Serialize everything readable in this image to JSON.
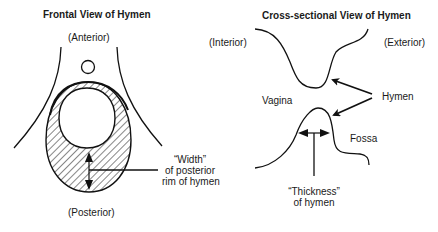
{
  "frontal": {
    "title": "Frontal View of Hymen",
    "anterior": "(Anterior)",
    "posterior": "(Posterior)",
    "width_label": [
      "“Width”",
      "of posterior",
      "rim of hymen"
    ]
  },
  "cross": {
    "title": "Cross-sectional View of Hymen",
    "interior": "(Interior)",
    "exterior": "(Exterior)",
    "vagina": "Vagina",
    "hymen": "Hymen",
    "fossa": "Fossa",
    "thickness_label": [
      "“Thickness”",
      "of hymen"
    ]
  }
}
